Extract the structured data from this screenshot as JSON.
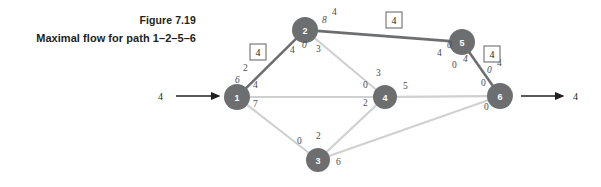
{
  "caption": {
    "figure_number": "Figure 7.19",
    "description": "Maximal flow for path 1–2–5–6"
  },
  "colors": {
    "node_fill": "#6d6e70",
    "edge_highlight": "#6d6e70",
    "edge_normal": "#cfd0d1",
    "text": "#231f20",
    "flow_label": "#4b4b4d"
  },
  "diagram": {
    "type": "network-flow",
    "source_node": "1",
    "sink_node": "6",
    "highlighted_path": "1-2-5-6",
    "path_flow": "4",
    "nodes": [
      {
        "id": "n1",
        "label": "1",
        "x": 237,
        "y": 97,
        "r": 13
      },
      {
        "id": "n2",
        "label": "2",
        "x": 305,
        "y": 30,
        "r": 13
      },
      {
        "id": "n3",
        "label": "3",
        "x": 318,
        "y": 160,
        "r": 12
      },
      {
        "id": "n4",
        "label": "4",
        "x": 385,
        "y": 97,
        "r": 12
      },
      {
        "id": "n5",
        "label": "5",
        "x": 462,
        "y": 42,
        "r": 13
      },
      {
        "id": "n6",
        "label": "6",
        "x": 500,
        "y": 96,
        "r": 13
      }
    ],
    "edges": [
      {
        "id": "e12",
        "from": "1",
        "to": "2",
        "highlighted": true
      },
      {
        "id": "e25",
        "from": "2",
        "to": "5",
        "highlighted": true
      },
      {
        "id": "e56",
        "from": "5",
        "to": "6",
        "highlighted": true
      },
      {
        "id": "e14",
        "from": "1",
        "to": "4",
        "highlighted": false
      },
      {
        "id": "e13",
        "from": "1",
        "to": "3",
        "highlighted": false
      },
      {
        "id": "e24",
        "from": "2",
        "to": "4",
        "highlighted": false
      },
      {
        "id": "e34",
        "from": "3",
        "to": "4",
        "highlighted": false
      },
      {
        "id": "e36",
        "from": "3",
        "to": "6",
        "highlighted": false
      },
      {
        "id": "e46",
        "from": "4",
        "to": "6",
        "highlighted": false
      }
    ],
    "flow_labels": [
      {
        "id": "f_n1_e12_out",
        "value": "2",
        "x": 243,
        "y": 71,
        "italic": false
      },
      {
        "id": "f_n1_e12_in",
        "value": "6",
        "x": 235,
        "y": 83,
        "italic": true
      },
      {
        "id": "f_n1_e14",
        "value": "4",
        "x": 253,
        "y": 88,
        "italic": false
      },
      {
        "id": "f_n1_e13",
        "value": "7",
        "x": 253,
        "y": 107,
        "italic": false
      },
      {
        "id": "f_n2_e12",
        "value": "4",
        "x": 290,
        "y": 53,
        "italic": false
      },
      {
        "id": "f_n2_e12b",
        "value": "0",
        "x": 302,
        "y": 48,
        "italic": true
      },
      {
        "id": "f_n2_e24",
        "value": "3",
        "x": 316,
        "y": 52,
        "italic": false
      },
      {
        "id": "f_n2_e25",
        "value": "8",
        "x": 322,
        "y": 23,
        "italic": true
      },
      {
        "id": "f_n2_e25b",
        "value": "4",
        "x": 332,
        "y": 15,
        "italic": false
      },
      {
        "id": "f_n5_e25",
        "value": "4",
        "x": 437,
        "y": 56,
        "italic": false
      },
      {
        "id": "f_n5_e25b",
        "value": "0",
        "x": 447,
        "y": 48,
        "italic": true
      },
      {
        "id": "f_n5_e56",
        "value": "0",
        "x": 452,
        "y": 68,
        "italic": false
      },
      {
        "id": "f_n5_e56b",
        "value": "4",
        "x": 463,
        "y": 62,
        "italic": true
      },
      {
        "id": "f_n6_e56",
        "value": "0",
        "x": 487,
        "y": 73,
        "italic": true
      },
      {
        "id": "f_n6_e56b",
        "value": "4",
        "x": 497,
        "y": 66,
        "italic": false
      },
      {
        "id": "f_n6_e56c",
        "value": "0",
        "x": 481,
        "y": 86,
        "italic": false
      },
      {
        "id": "f_n6_e36",
        "value": "0",
        "x": 484,
        "y": 110,
        "italic": false
      },
      {
        "id": "f_n4_e24",
        "value": "3",
        "x": 376,
        "y": 76,
        "italic": false
      },
      {
        "id": "f_n4_e14",
        "value": "0",
        "x": 363,
        "y": 88,
        "italic": false
      },
      {
        "id": "f_n4_e34",
        "value": "2",
        "x": 363,
        "y": 106,
        "italic": false
      },
      {
        "id": "f_n4_e46",
        "value": "5",
        "x": 403,
        "y": 89,
        "italic": false
      },
      {
        "id": "f_n3_e13",
        "value": "0",
        "x": 297,
        "y": 144,
        "italic": false
      },
      {
        "id": "f_n3_e34",
        "value": "2",
        "x": 316,
        "y": 139,
        "italic": false
      },
      {
        "id": "f_n3_e36",
        "value": "6",
        "x": 336,
        "y": 165,
        "italic": false
      }
    ],
    "boxed_labels": [
      {
        "id": "box_e12",
        "value": "4",
        "x": 258,
        "y": 52
      },
      {
        "id": "box_e25",
        "value": "4",
        "x": 394,
        "y": 20
      },
      {
        "id": "box_e56",
        "value": "4",
        "x": 492,
        "y": 54
      }
    ],
    "io_arrows": [
      {
        "id": "inflow",
        "value": "4",
        "label_x": 163,
        "label_y": 96,
        "line_x1": 176,
        "line_x2": 219,
        "y": 96
      },
      {
        "id": "outflow",
        "value": "4",
        "label_x": 573,
        "label_y": 96,
        "line_x1": 521,
        "line_x2": 563,
        "y": 96
      }
    ]
  }
}
